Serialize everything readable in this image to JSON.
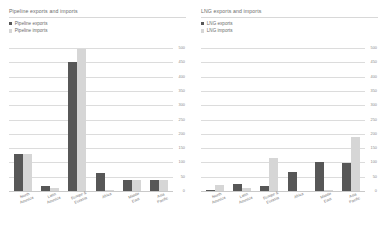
{
  "charts": [
    {
      "title": "Pipeline exports and imports",
      "legend": [
        {
          "label": "Pipeline exports",
          "color": "#575757"
        },
        {
          "label": "Pipeline imports",
          "color": "#d6d6d6"
        }
      ]
    },
    {
      "title": "LNG exports and imports",
      "legend": [
        {
          "label": "LNG exports",
          "color": "#575757"
        },
        {
          "label": "LNG imports",
          "color": "#d6d6d6"
        }
      ]
    }
  ],
  "chart_data": [
    {
      "type": "bar",
      "title": "Pipeline exports and imports",
      "xlabel": "",
      "ylabel": "",
      "ylim": [
        0,
        500
      ],
      "yticks": [
        500,
        450,
        400,
        350,
        300,
        250,
        200,
        150,
        100,
        50,
        0
      ],
      "ytick_labels": [
        "500",
        "450",
        "400",
        "350",
        "300",
        "250",
        "200",
        "150",
        "100",
        "50",
        "0"
      ],
      "grid": true,
      "axis_position": "right",
      "legend_position": "top-left",
      "categories": [
        "North America",
        "Latin America",
        "Europe & Eurasia",
        "Africa",
        "Middle East",
        "Asia Pacific"
      ],
      "category_lines": [
        [
          "North",
          "America"
        ],
        [
          "Latin",
          "America"
        ],
        [
          "Europe &",
          "Eurasia"
        ],
        [
          "Africa",
          ""
        ],
        [
          "Middle",
          "East"
        ],
        [
          "Asia",
          "Pacific"
        ]
      ],
      "series": [
        {
          "name": "Pipeline exports",
          "color": "#575757",
          "values": [
            130,
            18,
            450,
            62,
            37,
            38
          ]
        },
        {
          "name": "Pipeline imports",
          "color": "#d6d6d6",
          "values": [
            130,
            10,
            495,
            3,
            37,
            40
          ]
        }
      ]
    },
    {
      "type": "bar",
      "title": "LNG exports and imports",
      "xlabel": "",
      "ylabel": "",
      "ylim": [
        0,
        500
      ],
      "yticks": [
        500,
        450,
        400,
        350,
        300,
        250,
        200,
        150,
        100,
        50,
        0
      ],
      "ytick_labels": [
        "500",
        "450",
        "400",
        "350",
        "300",
        "250",
        "200",
        "150",
        "100",
        "50",
        "0"
      ],
      "grid": true,
      "axis_position": "right",
      "legend_position": "top-left",
      "categories": [
        "North America",
        "Latin America",
        "Europe & Eurasia",
        "Africa",
        "Middle East",
        "Asia Pacific"
      ],
      "category_lines": [
        [
          "North",
          "America"
        ],
        [
          "Latin",
          "America"
        ],
        [
          "Europe &",
          "Eurasia"
        ],
        [
          "Africa",
          ""
        ],
        [
          "Middle",
          "East"
        ],
        [
          "Asia",
          "Pacific"
        ]
      ],
      "series": [
        {
          "name": "LNG exports",
          "color": "#575757",
          "values": [
            3,
            25,
            18,
            68,
            100,
            98
          ]
        },
        {
          "name": "LNG imports",
          "color": "#d6d6d6",
          "values": [
            22,
            10,
            117,
            0,
            2,
            190
          ]
        }
      ]
    }
  ]
}
